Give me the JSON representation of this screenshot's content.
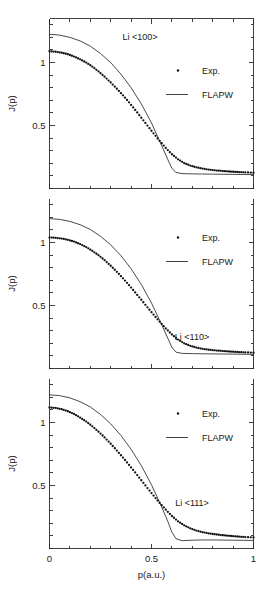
{
  "figure": {
    "name": "li-compton-profiles",
    "xlabel": "p(a.u.)",
    "ylabel": "J(p)",
    "x_ticklabels": [
      "0",
      "0.5",
      "1"
    ],
    "y_ticklabels": [
      "0.5",
      "1"
    ],
    "zero_label": "0"
  },
  "legend": {
    "exp_label": "Exp.",
    "theory_label": "FLAPW"
  },
  "panels": [
    {
      "title": "Li  <100>"
    },
    {
      "title": "Li  <110>"
    },
    {
      "title": "Li  <111>"
    }
  ],
  "chart_data": {
    "type": "line",
    "xlabel": "p(a.u.)",
    "ylabel": "J(p)",
    "xlim": [
      0,
      1
    ],
    "xticks": [
      0,
      0.1,
      0.2,
      0.3,
      0.4,
      0.5,
      0.6,
      0.7,
      0.8,
      0.9,
      1
    ],
    "xticklabels_shown": {
      "0": "0",
      "0.5": "0.5",
      "1": "1"
    },
    "grid": false,
    "legend_position": "upper right inside each panel",
    "panels": [
      {
        "name": "Li <100>",
        "direction": "<100>",
        "ylim": [
          0.0,
          1.35
        ],
        "yticks": [
          0.0,
          0.1,
          0.2,
          0.3,
          0.4,
          0.5,
          0.6,
          0.7,
          0.8,
          0.9,
          1.0,
          1.1,
          1.2,
          1.3
        ],
        "yticklabels_shown": {
          "0.5": "0.5",
          "1": "1"
        },
        "series": [
          {
            "name": "FLAPW",
            "style": "line",
            "x": [
              0.0,
              0.05,
              0.1,
              0.15,
              0.2,
              0.25,
              0.3,
              0.35,
              0.4,
              0.45,
              0.5,
              0.55,
              0.58,
              0.6,
              0.62,
              0.65,
              0.7,
              0.75,
              0.8,
              0.85,
              0.9,
              0.95,
              1.0
            ],
            "y": [
              1.225,
              1.218,
              1.2,
              1.172,
              1.13,
              1.072,
              1.0,
              0.908,
              0.8,
              0.672,
              0.52,
              0.34,
              0.23,
              0.16,
              0.128,
              0.118,
              0.116,
              0.115,
              0.114,
              0.113,
              0.112,
              0.111,
              0.11
            ]
          },
          {
            "name": "Exp.",
            "style": "points",
            "x": [
              0.0,
              0.03,
              0.06,
              0.09,
              0.12,
              0.15,
              0.18,
              0.21,
              0.24,
              0.27,
              0.3,
              0.33,
              0.36,
              0.39,
              0.42,
              0.45,
              0.48,
              0.51,
              0.54,
              0.57,
              0.6,
              0.63,
              0.66,
              0.69,
              0.72,
              0.75,
              0.78,
              0.81,
              0.84,
              0.87,
              0.9,
              0.93,
              0.96,
              1.0
            ],
            "y": [
              1.09,
              1.086,
              1.078,
              1.066,
              1.048,
              1.026,
              1.0,
              0.968,
              0.93,
              0.888,
              0.842,
              0.792,
              0.74,
              0.684,
              0.624,
              0.562,
              0.5,
              0.438,
              0.378,
              0.322,
              0.272,
              0.232,
              0.202,
              0.182,
              0.168,
              0.158,
              0.15,
              0.144,
              0.14,
              0.136,
              0.133,
              0.13,
              0.128,
              0.125
            ]
          }
        ]
      },
      {
        "name": "Li <110>",
        "direction": "<110>",
        "ylim": [
          0.0,
          1.35
        ],
        "yticks": [
          0.0,
          0.1,
          0.2,
          0.3,
          0.4,
          0.5,
          0.6,
          0.7,
          0.8,
          0.9,
          1.0,
          1.1,
          1.2,
          1.3
        ],
        "yticklabels_shown": {
          "0.5": "0.5",
          "1": "1"
        },
        "series": [
          {
            "name": "FLAPW",
            "style": "line",
            "x": [
              0.0,
              0.05,
              0.1,
              0.15,
              0.2,
              0.25,
              0.3,
              0.35,
              0.4,
              0.45,
              0.5,
              0.55,
              0.58,
              0.6,
              0.62,
              0.65,
              0.7,
              0.75,
              0.8,
              0.85,
              0.9,
              0.95,
              1.0
            ],
            "y": [
              1.19,
              1.184,
              1.168,
              1.142,
              1.104,
              1.05,
              0.982,
              0.896,
              0.792,
              0.668,
              0.52,
              0.348,
              0.24,
              0.168,
              0.13,
              0.12,
              0.118,
              0.117,
              0.116,
              0.115,
              0.114,
              0.113,
              0.112
            ]
          },
          {
            "name": "Exp.",
            "style": "points",
            "x": [
              0.0,
              0.03,
              0.06,
              0.09,
              0.12,
              0.15,
              0.18,
              0.21,
              0.24,
              0.27,
              0.3,
              0.33,
              0.36,
              0.39,
              0.42,
              0.45,
              0.48,
              0.51,
              0.54,
              0.57,
              0.6,
              0.63,
              0.66,
              0.69,
              0.72,
              0.75,
              0.78,
              0.81,
              0.84,
              0.87,
              0.9,
              0.93,
              0.96,
              1.0
            ],
            "y": [
              1.04,
              1.038,
              1.032,
              1.022,
              1.008,
              0.988,
              0.964,
              0.934,
              0.9,
              0.86,
              0.816,
              0.768,
              0.716,
              0.662,
              0.604,
              0.546,
              0.486,
              0.428,
              0.372,
              0.318,
              0.27,
              0.23,
              0.2,
              0.18,
              0.166,
              0.156,
              0.149,
              0.144,
              0.14,
              0.136,
              0.133,
              0.13,
              0.128,
              0.126
            ]
          }
        ]
      },
      {
        "name": "Li <111>",
        "direction": "<111>",
        "ylim": [
          0.0,
          1.35
        ],
        "yticks": [
          0.0,
          0.1,
          0.2,
          0.3,
          0.4,
          0.5,
          0.6,
          0.7,
          0.8,
          0.9,
          1.0,
          1.1,
          1.2,
          1.3
        ],
        "yticklabels_shown": {
          "0.5": "0.5",
          "1": "1"
        },
        "series": [
          {
            "name": "FLAPW",
            "style": "line",
            "x": [
              0.0,
              0.05,
              0.1,
              0.15,
              0.2,
              0.25,
              0.3,
              0.35,
              0.4,
              0.45,
              0.5,
              0.55,
              0.58,
              0.6,
              0.62,
              0.65,
              0.7,
              0.75,
              0.8,
              0.85,
              0.9,
              0.95,
              1.0
            ],
            "y": [
              1.22,
              1.214,
              1.196,
              1.166,
              1.124,
              1.064,
              0.99,
              0.898,
              0.788,
              0.658,
              0.506,
              0.33,
              0.215,
              0.13,
              0.078,
              0.062,
              0.066,
              0.068,
              0.068,
              0.067,
              0.066,
              0.065,
              0.064
            ]
          },
          {
            "name": "Exp.",
            "style": "points",
            "x": [
              0.0,
              0.03,
              0.06,
              0.09,
              0.12,
              0.15,
              0.18,
              0.21,
              0.24,
              0.27,
              0.3,
              0.33,
              0.36,
              0.39,
              0.42,
              0.45,
              0.48,
              0.51,
              0.54,
              0.57,
              0.6,
              0.63,
              0.66,
              0.69,
              0.72,
              0.75,
              0.78,
              0.81,
              0.84,
              0.87,
              0.9,
              0.93,
              0.96,
              1.0
            ],
            "y": [
              1.12,
              1.116,
              1.106,
              1.09,
              1.068,
              1.04,
              1.008,
              0.97,
              0.928,
              0.882,
              0.832,
              0.778,
              0.722,
              0.664,
              0.604,
              0.542,
              0.48,
              0.42,
              0.362,
              0.308,
              0.258,
              0.216,
              0.184,
              0.16,
              0.142,
              0.13,
              0.12,
              0.113,
              0.107,
              0.102,
              0.098,
              0.094,
              0.091,
              0.088
            ]
          }
        ]
      }
    ]
  }
}
